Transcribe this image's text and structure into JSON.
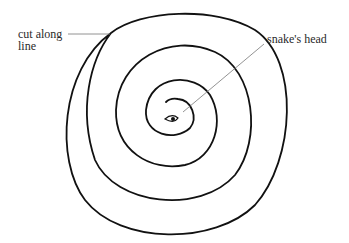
{
  "diagram": {
    "labels": {
      "cut_line_1": "cut along",
      "cut_line_2": "line",
      "snake_head": "snake's head"
    },
    "colors": {
      "stroke": "#111111",
      "leader": "#777777",
      "text": "#2a2a2a",
      "background": "#ffffff"
    }
  }
}
